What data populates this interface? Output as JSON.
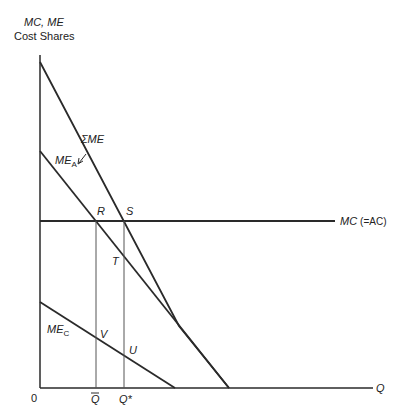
{
  "axes": {
    "y_label_line1": "MC, ME",
    "y_label_line2": "Cost Shares",
    "x_label": "Q",
    "origin": "0"
  },
  "curves": {
    "sum_me": {
      "label": "ΣME"
    },
    "me_a": {
      "label_main": "ME",
      "label_sub": "A"
    },
    "me_c": {
      "label_main": "ME",
      "label_sub": "C"
    },
    "mc": {
      "label_main": "MC",
      "label_paren": "(=AC)"
    }
  },
  "points": {
    "R": "R",
    "S": "S",
    "T": "T",
    "U": "U",
    "V": "V"
  },
  "ticks": {
    "q_bar": "Q",
    "q_star": "Q*"
  },
  "colors": {
    "line": "#2a2a2a",
    "thin": "#555555"
  }
}
